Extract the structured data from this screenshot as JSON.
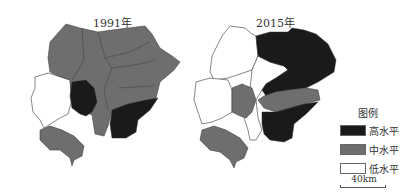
{
  "maps": [
    {
      "title": "1991年",
      "regions": [
        {
          "id": "north-west",
          "level": "mid"
        },
        {
          "id": "north-central",
          "level": "mid"
        },
        {
          "id": "north-east",
          "level": "mid"
        },
        {
          "id": "central",
          "level": "mid"
        },
        {
          "id": "east",
          "level": "mid"
        },
        {
          "id": "west-outline",
          "level": "low"
        },
        {
          "id": "center-dark",
          "level": "high"
        },
        {
          "id": "south-east-dark",
          "level": "high"
        },
        {
          "id": "south-central",
          "level": "mid"
        },
        {
          "id": "south-west",
          "level": "mid"
        }
      ]
    },
    {
      "title": "2015年",
      "regions": [
        {
          "id": "north-west",
          "level": "low"
        },
        {
          "id": "north-east",
          "level": "high"
        },
        {
          "id": "west",
          "level": "low"
        },
        {
          "id": "center-west",
          "level": "mid"
        },
        {
          "id": "center-east-band",
          "level": "mid"
        },
        {
          "id": "center-gap",
          "level": "low"
        },
        {
          "id": "south-east",
          "level": "high"
        },
        {
          "id": "south-west",
          "level": "mid"
        }
      ]
    }
  ],
  "legend": {
    "title": "图例",
    "items": [
      {
        "label": "高水平",
        "color": "#1a1a1a"
      },
      {
        "label": "中水平",
        "color": "#6e6e6e"
      },
      {
        "label": "低水平",
        "color": "#ffffff"
      }
    ]
  },
  "scale": {
    "label": "40km"
  },
  "colors": {
    "high": "#1a1a1a",
    "mid": "#6e6e6e",
    "low": "#ffffff",
    "stroke": "#555555"
  }
}
